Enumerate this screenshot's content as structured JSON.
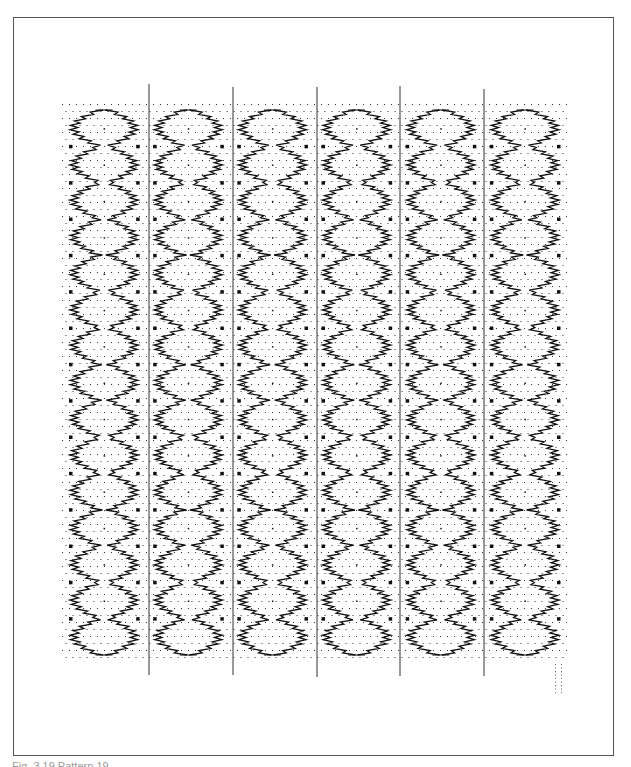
{
  "figure": {
    "caption": "Fig. 3.19 Pattern 19"
  },
  "pattern": {
    "columns": 6,
    "diamonds_per_column": 15,
    "ink_color": "#111111",
    "grid_dot_color": "#333333",
    "frame_color": "#555555"
  }
}
